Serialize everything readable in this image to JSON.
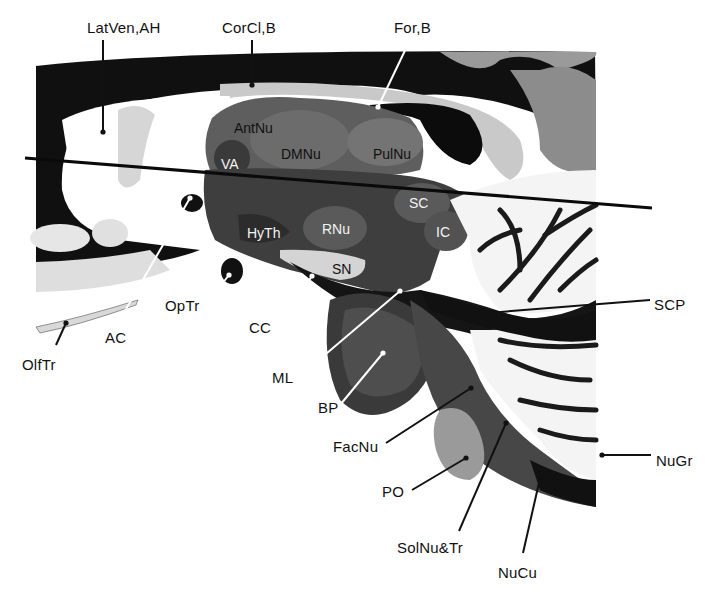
{
  "figure": {
    "colors": {
      "background": "#ffffff",
      "white_matter_dark": "#0e0e0e",
      "gray_tissue": "#6a6a6a",
      "label_text": "#111111",
      "leader_line_dark": "#111111",
      "leader_line_light": "#ffffff"
    }
  },
  "external_labels": [
    {
      "id": "latven-ah",
      "text": "LatVen,AH",
      "x": 87,
      "y": 20,
      "line": [
        [
          103,
          40
        ],
        [
          103,
          132
        ]
      ],
      "dot": [
        103,
        132
      ],
      "line_color": "dark"
    },
    {
      "id": "corcl-b",
      "text": "CorCl,B",
      "x": 222,
      "y": 20,
      "line": [
        [
          252,
          40
        ],
        [
          252,
          85
        ]
      ],
      "dot": [
        252,
        85
      ],
      "line_color": "dark"
    },
    {
      "id": "for-b",
      "text": "For,B",
      "x": 394,
      "y": 20,
      "line": [
        [
          410,
          40
        ],
        [
          378,
          107
        ]
      ],
      "dot": [
        378,
        107
      ],
      "line_color": "light"
    },
    {
      "id": "ac",
      "text": "AC",
      "x": 105,
      "y": 330,
      "line": [
        [
          118,
          323
        ],
        [
          190,
          198
        ]
      ],
      "dot": [
        190,
        198
      ],
      "line_color": "light"
    },
    {
      "id": "optr",
      "text": "OpTr",
      "x": 165,
      "y": 298,
      "line": [
        [
          203,
          308
        ],
        [
          229,
          275
        ]
      ],
      "dot": [
        229,
        275
      ],
      "line_color": "light"
    },
    {
      "id": "olftr",
      "text": "OlfTr",
      "x": 22,
      "y": 357,
      "line": [
        [
          56,
          345
        ],
        [
          66,
          323
        ]
      ],
      "dot": [
        66,
        323
      ],
      "line_color": "dark"
    },
    {
      "id": "cc",
      "text": "CC",
      "x": 249,
      "y": 320,
      "line": [
        [
          278,
          328
        ],
        [
          312,
          276
        ]
      ],
      "dot": [
        312,
        276
      ],
      "line_color": "light"
    },
    {
      "id": "ml",
      "text": "ML",
      "x": 272,
      "y": 370,
      "line": [
        [
          300,
          376
        ],
        [
          400,
          291
        ]
      ],
      "dot": [
        400,
        291
      ],
      "line_color": "light"
    },
    {
      "id": "bp",
      "text": "BP",
      "x": 318,
      "y": 400,
      "line": [
        [
          340,
          405
        ],
        [
          383,
          353
        ]
      ],
      "dot": [
        383,
        353
      ],
      "line_color": "light"
    },
    {
      "id": "scp",
      "text": "SCP",
      "x": 654,
      "y": 297,
      "line": [
        [
          650,
          300
        ],
        [
          475,
          314
        ]
      ],
      "dot": [
        475,
        314
      ],
      "line_color": "dark"
    },
    {
      "id": "facnu",
      "text": "FacNu",
      "x": 333,
      "y": 439,
      "line": [
        [
          386,
          443
        ],
        [
          471,
          388
        ]
      ],
      "dot": [
        471,
        388
      ],
      "line_color": "dark"
    },
    {
      "id": "nugr",
      "text": "NuGr",
      "x": 656,
      "y": 453,
      "line": [
        [
          651,
          455
        ],
        [
          602,
          455
        ]
      ],
      "dot": [
        602,
        455
      ],
      "line_color": "dark"
    },
    {
      "id": "po",
      "text": "PO",
      "x": 382,
      "y": 484,
      "line": [
        [
          412,
          490
        ],
        [
          466,
          458
        ]
      ],
      "dot": [
        466,
        458
      ],
      "line_color": "dark"
    },
    {
      "id": "solnu-tr",
      "text": "SolNu&Tr",
      "x": 397,
      "y": 540,
      "line": [
        [
          459,
          531
        ],
        [
          506,
          423
        ]
      ],
      "dot": [
        506,
        423
      ],
      "line_color": "dark"
    },
    {
      "id": "nucu",
      "text": "NuCu",
      "x": 498,
      "y": 565,
      "line": [
        [
          523,
          553
        ],
        [
          541,
          474
        ]
      ],
      "dot": [
        541,
        474
      ],
      "line_color": "dark"
    }
  ],
  "internal_labels": [
    {
      "id": "antnu",
      "text": "AntNu",
      "x": 234,
      "y": 121,
      "tone": "dark"
    },
    {
      "id": "dmnu",
      "text": "DMNu",
      "x": 281,
      "y": 147,
      "tone": "dark"
    },
    {
      "id": "pulnu",
      "text": "PulNu",
      "x": 373,
      "y": 147,
      "tone": "dark"
    },
    {
      "id": "va",
      "text": "VA",
      "x": 221,
      "y": 157,
      "tone": "light"
    },
    {
      "id": "sc",
      "text": "SC",
      "x": 409,
      "y": 196,
      "tone": "light"
    },
    {
      "id": "hyth",
      "text": "HyTh",
      "x": 247,
      "y": 226,
      "tone": "light"
    },
    {
      "id": "rnu",
      "text": "RNu",
      "x": 322,
      "y": 222,
      "tone": "light"
    },
    {
      "id": "ic",
      "text": "IC",
      "x": 436,
      "y": 225,
      "tone": "light"
    },
    {
      "id": "sn",
      "text": "SN",
      "x": 332,
      "y": 262,
      "tone": "dark"
    }
  ],
  "cutting_line": {
    "x1": 25,
    "y1": 158,
    "x2": 652,
    "y2": 208
  }
}
